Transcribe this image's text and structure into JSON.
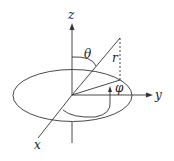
{
  "diagram": {
    "labels": {
      "z": "z",
      "y": "y",
      "x": "x",
      "r": "r",
      "theta": "θ",
      "phi": "φ"
    },
    "colors": {
      "stroke": "#333333",
      "background": "#ffffff"
    }
  }
}
